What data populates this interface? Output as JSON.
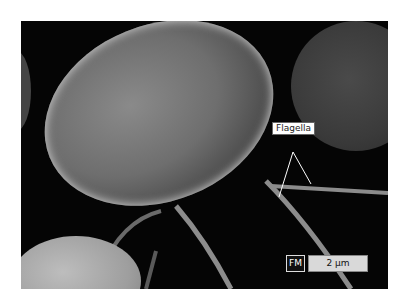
{
  "image": {
    "description": "Scanning electron micrograph of an oval bacterial cell with flagella",
    "label": "Flagella",
    "microscopy_badge": "FM",
    "scale_bar": "2 µm"
  }
}
